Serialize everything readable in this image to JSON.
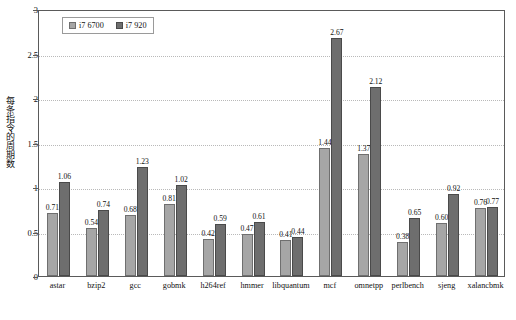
{
  "chart_data": {
    "type": "bar",
    "title": "",
    "subtitle": "",
    "xlabel": "",
    "ylabel": "每条指令的周期数",
    "ylim": [
      0,
      3
    ],
    "ytick_labels": [
      "0",
      "0.5",
      "1",
      "1.5",
      "2",
      "2.5",
      "3"
    ],
    "ytick_values": [
      0,
      0.5,
      1,
      1.5,
      2,
      2.5,
      3
    ],
    "grid": true,
    "grid_axis": "y",
    "legend_position": "top-left-inside",
    "categories": [
      "astar",
      "bzip2",
      "gcc",
      "gobmk",
      "h264ref",
      "hmmer",
      "libquantum",
      "mcf",
      "omnetpp",
      "perlbench",
      "sjeng",
      "xalancbmk"
    ],
    "series": [
      {
        "name": "i7 6700",
        "color": "#a6a6a6",
        "values": [
          0.71,
          0.54,
          0.68,
          0.81,
          0.42,
          0.47,
          0.41,
          1.44,
          1.37,
          0.38,
          0.6,
          0.76
        ],
        "labels": [
          "0.71",
          "0.54",
          "0.68",
          "0.81",
          "0.42",
          "0.47",
          "0.41",
          "1.44",
          "1.37",
          "0.38",
          "0.60",
          "0.76"
        ]
      },
      {
        "name": "i7 920",
        "color": "#6e6e6e",
        "values": [
          1.06,
          0.74,
          1.23,
          1.02,
          0.59,
          0.61,
          0.44,
          2.67,
          2.12,
          0.65,
          0.92,
          0.77
        ],
        "labels": [
          "1.06",
          "0.74",
          "1.23",
          "1.02",
          "0.59",
          "0.61",
          "0.44",
          "2.67",
          "2.12",
          "0.65",
          "0.92",
          "0.77"
        ]
      }
    ]
  },
  "legend": {
    "entries": [
      {
        "label": "i7 6700"
      },
      {
        "label": "i7 920"
      }
    ]
  }
}
